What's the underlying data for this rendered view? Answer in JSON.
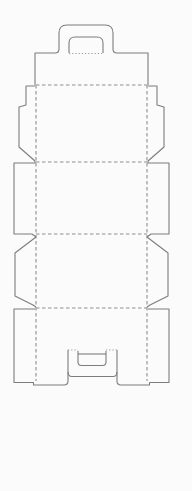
{
  "diagram": {
    "kind": "box-dieline-template",
    "canvas": {
      "width": 192,
      "height": 491
    },
    "background": "#fbfbfb",
    "stroke": {
      "solid": "#7d7d7d",
      "dashed": "#8f8f8f",
      "dotted": "#9c9c9c",
      "width": 1.1,
      "dash_pattern": "3.5 2.5",
      "dot_pattern": "1.2 2"
    },
    "paths": [
      {
        "name": "top-flap-and-handle-tab-outline",
        "style": "solid",
        "d": "M 35,85 L 35,53 L 55,53 Q 59,53 59,49 L 59,33 Q 59,25 67,25 L 105,25 Q 113,25 113,33 L 113,49 Q 113,53 117,53 L 148,53 L 148,85"
      },
      {
        "name": "handle-inner-cutout",
        "style": "solid",
        "d": "M 69,53 L 69,43 Q 69,37 75,37 L 97,37 Q 103,37 103,43 L 103,53"
      },
      {
        "name": "handle-fold-line",
        "style": "dotted",
        "d": "M 69,53.5 L 103,53.5"
      },
      {
        "name": "fold-line-top-flap",
        "style": "dashed",
        "d": "M 36,85 L 147,85"
      },
      {
        "name": "fold-line-panel-1-2",
        "style": "dashed",
        "d": "M 36,162 L 147,162"
      },
      {
        "name": "fold-line-panel-2-3",
        "style": "dashed",
        "d": "M 36,234 L 147,234"
      },
      {
        "name": "fold-line-bottom-flap",
        "style": "dashed",
        "d": "M 36,308 L 147,308"
      },
      {
        "name": "fold-line-left-vertical",
        "style": "dashed",
        "d": "M 36,85 L 36,381"
      },
      {
        "name": "fold-line-right-vertical",
        "style": "dashed",
        "d": "M 147,85 L 147,381"
      },
      {
        "name": "side-flap-1-left-outline",
        "style": "solid",
        "d": "M 35,86 L 26,86 L 26,105 L 19,107 L 19,147 L 35,161"
      },
      {
        "name": "side-flap-1-right-outline",
        "style": "solid",
        "d": "M 148,86 L 157,86 L 157,105 L 164,107 L 164,147 L 148,161"
      },
      {
        "name": "side-flap-2-left-outline",
        "style": "solid",
        "d": "M 35,161 L 35,163 L 14,163 L 14,234 L 32,234 L 36,237"
      },
      {
        "name": "side-flap-2-right-outline",
        "style": "solid",
        "d": "M 148,161 L 148,163 L 169,163 L 169,234 L 151,234 L 147,237"
      },
      {
        "name": "side-flap-3-left-outline",
        "style": "solid",
        "d": "M 36,237 L 15,253 L 15,296 L 33,305 L 36,307"
      },
      {
        "name": "side-flap-3-right-outline",
        "style": "solid",
        "d": "M 147,237 L 168,253 L 168,296 L 150,305 L 147,307"
      },
      {
        "name": "bottom-tab-left-and-flap-edge",
        "style": "solid",
        "d": "M 35,309 L 14,309 L 14,382.5 L 33.5,382.5 L 33.5,385 L 64,385 Q 68,385 68,381 L 68,350"
      },
      {
        "name": "bottom-tab-right-and-flap-edge",
        "style": "solid",
        "d": "M 148,309 L 169,309 L 169,382.5 L 149.5,382.5 L 149.5,385 L 121,385 Q 117,385 117,381 L 117,350"
      },
      {
        "name": "lock-slot-center-bottom-edge",
        "style": "solid",
        "d": "M 68,372 Q 68,376.5 72,376.5 L 113,376.5 Q 117,376.5 117,372"
      },
      {
        "name": "lock-slot-fold-left",
        "style": "dotted",
        "d": "M 68,350 L 78,350"
      },
      {
        "name": "lock-slot-fold-right",
        "style": "dotted",
        "d": "M 106,350 L 117,350"
      },
      {
        "name": "lock-slot-inner-cut",
        "style": "solid",
        "d": "M 78,351 L 78,362 Q 78,365.5 81.5,365.5 L 102.5,365.5 Q 106,365.5 106,362 L 106,351"
      },
      {
        "name": "lock-slot-crossbar-cut",
        "style": "solid",
        "d": "M 78,354 L 106,354"
      }
    ]
  }
}
